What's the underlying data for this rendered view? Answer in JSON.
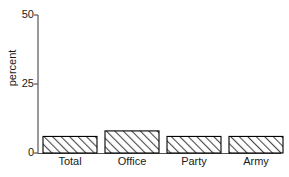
{
  "chart_data": {
    "type": "bar",
    "title": "",
    "subtitle": "",
    "xlabel": "",
    "ylabel": "percent",
    "categories": [
      "Total",
      "Office",
      "Party",
      "Army"
    ],
    "values": [
      6,
      8,
      6,
      6
    ],
    "ylim": [
      0,
      50
    ],
    "yticks": [
      0,
      25,
      50
    ],
    "ytick_labels": [
      "0",
      "25",
      "50"
    ],
    "grid": false,
    "legend": false,
    "legend_position": "none",
    "bar_fill": "hatch-diagonal",
    "bar_edge_color": "#000000",
    "background_color": "#ffffff",
    "axis_color": "#555555"
  },
  "axis": {
    "y_label": "percent",
    "tick_0": "0",
    "tick_25": "25",
    "tick_50": "50"
  },
  "bars": [
    {
      "label": "Total",
      "value": 6
    },
    {
      "label": "Office",
      "value": 8
    },
    {
      "label": "Party",
      "value": 6
    },
    {
      "label": "Army",
      "value": 6
    }
  ]
}
